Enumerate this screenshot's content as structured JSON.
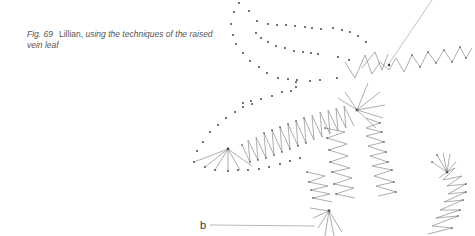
{
  "caption": {
    "figure": "Fig. 69",
    "name": "Lillian,",
    "description": "using the techniques of the raised vein leaf"
  },
  "labels": {
    "b": "b"
  },
  "colors": {
    "dot": "#333333",
    "thread": "#777777",
    "text": "#555555"
  }
}
